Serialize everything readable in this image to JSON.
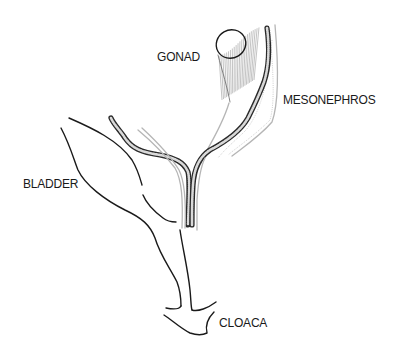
{
  "diagram": {
    "labels": {
      "gonad": "GONAD",
      "mesonephros": "MESONEPHROS",
      "bladder": "BLADDER",
      "cloaca": "CLOACA"
    },
    "colors": {
      "ink": "#1a1a1a",
      "stipple": "#b5b5b5",
      "background": "#ffffff"
    }
  }
}
